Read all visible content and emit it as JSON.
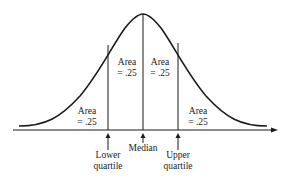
{
  "diagram": {
    "type": "normal-distribution-quartiles",
    "areas": [
      {
        "label": "Area",
        "value": "= .25",
        "region": "left-tail"
      },
      {
        "label": "Area",
        "value": "= .25",
        "region": "lower-to-median"
      },
      {
        "label": "Area",
        "value": "= .25",
        "region": "median-to-upper"
      },
      {
        "label": "Area",
        "value": "= .25",
        "region": "right-tail"
      }
    ],
    "markers": [
      {
        "line1": "Lower",
        "line2": "quartile"
      },
      {
        "line1": "Median",
        "line2": ""
      },
      {
        "line1": "Upper",
        "line2": "quartile"
      }
    ],
    "colors": {
      "ink": "#1a1a1a",
      "background": "#ffffff"
    }
  }
}
